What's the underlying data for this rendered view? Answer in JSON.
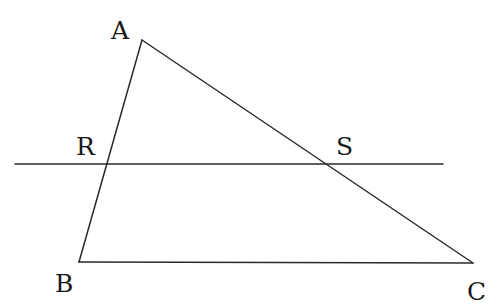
{
  "diagram": {
    "type": "geometry",
    "points": {
      "A": {
        "label": "A",
        "x": 142,
        "y": 40
      },
      "B": {
        "label": "B",
        "x": 79,
        "y": 262
      },
      "C": {
        "label": "C",
        "x": 473,
        "y": 263
      },
      "R": {
        "label": "R",
        "x": 107,
        "y": 164
      },
      "S": {
        "label": "S",
        "x": 330,
        "y": 164
      }
    },
    "segments": [
      {
        "from": "A",
        "to": "B"
      },
      {
        "from": "B",
        "to": "C"
      },
      {
        "from": "A",
        "to": "C"
      }
    ],
    "transversal": {
      "x1": 15,
      "y1": 164,
      "x2": 443,
      "y2": 164
    },
    "labels": {
      "A": {
        "text": "A",
        "x": 111,
        "y": 39
      },
      "B": {
        "text": "B",
        "x": 55,
        "y": 292
      },
      "C": {
        "text": "C",
        "x": 467,
        "y": 300
      },
      "R": {
        "text": "R",
        "x": 76,
        "y": 155
      },
      "S": {
        "text": "S",
        "x": 336,
        "y": 155
      }
    },
    "stroke_color": "#2a2a2a",
    "text_color": "#1a1a1a"
  }
}
